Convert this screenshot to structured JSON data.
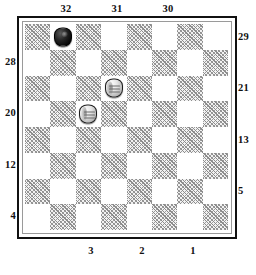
{
  "diagram": {
    "kind": "checkers-board-diagram",
    "board": {
      "rows": 8,
      "columns": 8,
      "shaded_square_color": "#8c8c8c",
      "light_square_color": "#ffffff",
      "border_color": "#111111",
      "inner_rule_color": "#9a9a9a"
    },
    "labels": {
      "top": [
        {
          "text": "32",
          "column": 2
        },
        {
          "text": "31",
          "column": 4
        },
        {
          "text": "30",
          "column": 6
        }
      ],
      "bottom": [
        {
          "text": "3",
          "column": 3
        },
        {
          "text": "2",
          "column": 5
        },
        {
          "text": "1",
          "column": 7
        }
      ],
      "left": [
        {
          "text": "28",
          "row": 2
        },
        {
          "text": "20",
          "row": 4
        },
        {
          "text": "12",
          "row": 6
        },
        {
          "text": "4",
          "row": 8
        }
      ],
      "right": [
        {
          "text": "29",
          "row": 1
        },
        {
          "text": "21",
          "row": 3
        },
        {
          "text": "13",
          "row": 5
        },
        {
          "text": "5",
          "row": 7
        }
      ]
    },
    "pieces": [
      {
        "id": "piece-black-1",
        "color": "black",
        "row": 1,
        "column": 2
      },
      {
        "id": "piece-white-1",
        "color": "white",
        "row": 3,
        "column": 4
      },
      {
        "id": "piece-white-2",
        "color": "white",
        "row": 4,
        "column": 3
      }
    ],
    "caption": ""
  }
}
